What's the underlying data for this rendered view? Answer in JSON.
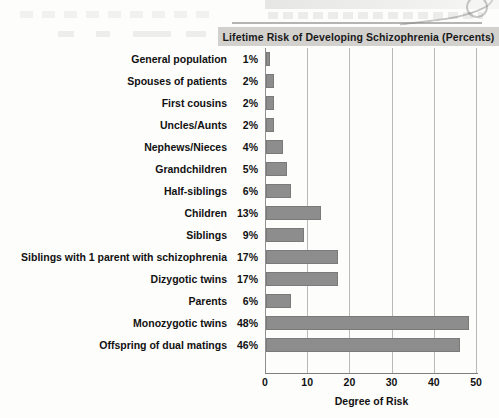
{
  "chart_data": {
    "type": "bar",
    "orientation": "horizontal",
    "title": "Lifetime Risk of Developing Schizophrenia (Percents)",
    "xlabel": "Degree of Risk",
    "ylabel": "",
    "xlim": [
      0,
      50
    ],
    "xticks": [
      0,
      10,
      20,
      30,
      40,
      50
    ],
    "grid": true,
    "legend": null,
    "categories": [
      "General population",
      "Spouses of patients",
      "First cousins",
      "Uncles/Aunts",
      "Nephews/Nieces",
      "Grandchildren",
      "Half-siblings",
      "Children",
      "Siblings",
      "Siblings with 1 parent with schizophrenia",
      "Dizygotic twins",
      "Parents",
      "Monozygotic twins",
      "Offspring of dual matings"
    ],
    "values": [
      1,
      2,
      2,
      2,
      4,
      5,
      6,
      13,
      9,
      17,
      17,
      6,
      48,
      46
    ],
    "value_labels": [
      "1%",
      "2%",
      "2%",
      "2%",
      "4%",
      "5%",
      "6%",
      "13%",
      "9%",
      "17%",
      "17%",
      "6%",
      "48%",
      "46%"
    ],
    "bar_color": "#8d8d8d",
    "title_background": "#d3d1ce",
    "grid_color": "#b9b9b9",
    "axis_color": "#7e7e7e"
  }
}
